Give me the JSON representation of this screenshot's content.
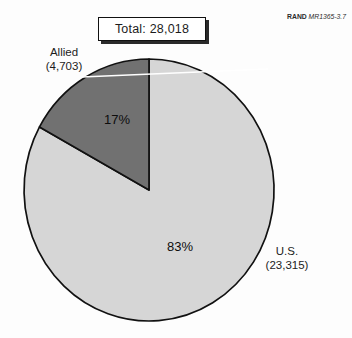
{
  "header": {
    "total_label": "Total: 28,018",
    "source_bold": "RAND",
    "source_italic": "MR1365-3.7"
  },
  "chart_data": {
    "type": "pie",
    "title": "Total: 28,018",
    "total": 28018,
    "start_angle": "top",
    "direction": "clockwise",
    "stroke_color": "#111111",
    "background_color": "#fdfdfd",
    "slices": [
      {
        "name": "U.S.",
        "value": 23315,
        "percent": 83,
        "percent_label": "83%",
        "label_line1": "U.S.",
        "label_line2": "(23,315)",
        "color": "#d6d6d6"
      },
      {
        "name": "Allied",
        "value": 4703,
        "percent": 17,
        "percent_label": "17%",
        "label_line1": "Allied",
        "label_line2": "(4,703)",
        "color": "#717171"
      }
    ]
  }
}
